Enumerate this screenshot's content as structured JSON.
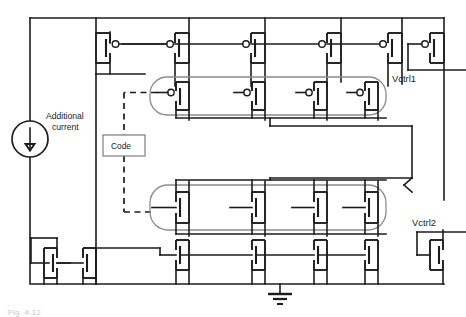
{
  "figure": {
    "type": "circuit-schematic",
    "caption_partial": "Fig. 4.12"
  },
  "labels": {
    "additional_current_line1": "Additional",
    "additional_current_line2": "current",
    "code_block": "Code",
    "vctrl1": "Vctrl1",
    "vctrl2": "Vctrl2"
  },
  "colors": {
    "wire": "#1c1c1c",
    "group_outline": "#8c8c8c",
    "code_box_outline": "#7d7d7d",
    "background": "#ffffff"
  },
  "components": {
    "current_source": {
      "name": "Additional current",
      "symbol": "circle-with-down-arrow",
      "arrow_direction": "down"
    },
    "ground": {
      "symbol": "earth-ground",
      "bars": 3
    },
    "pmos_top_row": {
      "type": "PMOS",
      "count": 5,
      "note": "top supply rail current mirror row with gate bubbles"
    },
    "pmos_coded_bank": {
      "type": "PMOS",
      "count": 4,
      "grouped": true,
      "controlled_by": "Code"
    },
    "nmos_coded_bank": {
      "type": "NMOS",
      "count": 4,
      "grouped": true,
      "controlled_by": "Code"
    },
    "nmos_bottom_row": {
      "type": "NMOS",
      "count": 4,
      "note": "bottom ground rail mirror row"
    },
    "nmos_left_pair": {
      "type": "NMOS",
      "count": 2,
      "note": "diode-connected reference pair at lower left"
    },
    "vctrl1_device": {
      "type": "PMOS",
      "diode_connected": true,
      "output_label": "Vctrl1"
    },
    "vctrl2_device": {
      "type": "NMOS",
      "diode_connected": true,
      "output_label": "Vctrl2"
    }
  }
}
